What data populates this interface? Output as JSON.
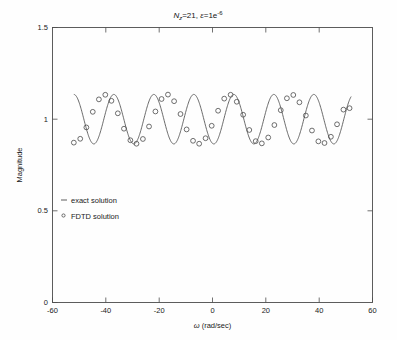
{
  "figure": {
    "background": "#fefefe",
    "axes_color": "#4d4d4d",
    "curve_color": "#595959",
    "marker_color": "#4a4a4a"
  },
  "title": {
    "n_symbol": "N",
    "n_sub": "z",
    "n_value": "=21,",
    "eps_symbol": "ε",
    "eps_value": "=1e",
    "eps_exp": "-6",
    "full": "N_z=21, ε=1e-6"
  },
  "axes": {
    "xlabel_symbol": "ω",
    "xlabel_unit": "(rad/sec)",
    "xlabel": "ω (rad/sec)",
    "ylabel": "Magnitude",
    "xticks": [
      "-60",
      "-40",
      "-20",
      "0",
      "20",
      "40",
      "60"
    ],
    "yticks": [
      "0",
      "0.5",
      "1",
      "1.5"
    ]
  },
  "legend": {
    "entries": [
      {
        "label": "exact solution",
        "marker": "line-dash-marker"
      },
      {
        "label": "FDTD solution",
        "marker": "circle-marker"
      }
    ]
  },
  "chart_data": {
    "type": "line",
    "xlabel": "ω (rad/sec)",
    "ylabel": "Magnitude",
    "xlim": [
      -60,
      60
    ],
    "ylim": [
      0,
      1.5
    ],
    "xticks": [
      -60,
      -40,
      -20,
      0,
      20,
      40,
      60
    ],
    "yticks": [
      0,
      0.5,
      1,
      1.5
    ],
    "grid": false,
    "legend_position": "inside-lower-left",
    "series": [
      {
        "name": "exact solution",
        "style": "line",
        "comment": "Smooth oscillation: magnitude ~ 1 + 0.135*cos(2*pi*(w+52)/15.0) sampled densely over w in [-52, 52]",
        "model": {
          "mean": 1.0,
          "amplitude": 0.135,
          "period": 15.0,
          "phase_ref_w": -52.0,
          "w_start": -52.0,
          "w_end": 52.0
        }
      },
      {
        "name": "FDTD solution",
        "style": "circles",
        "comment": "45 sample points on the same oscillation, spaced ~2.35 rad/sec apart, with small scatter",
        "x": [
          -52.0,
          -49.6,
          -47.3,
          -44.9,
          -42.6,
          -40.2,
          -37.9,
          -35.5,
          -33.2,
          -30.8,
          -28.5,
          -26.1,
          -23.8,
          -21.4,
          -19.1,
          -16.7,
          -14.4,
          -12.0,
          -9.7,
          -7.3,
          -5.0,
          -2.6,
          -0.3,
          2.1,
          4.4,
          6.8,
          9.1,
          11.5,
          13.8,
          16.2,
          18.5,
          20.9,
          23.2,
          25.6,
          27.9,
          30.3,
          32.6,
          35.0,
          37.3,
          39.7,
          42.0,
          44.4,
          46.7,
          49.1,
          51.4
        ],
        "y": [
          0.872,
          0.893,
          0.955,
          1.04,
          1.108,
          1.133,
          1.1,
          1.032,
          0.948,
          0.885,
          0.866,
          0.892,
          0.96,
          1.042,
          1.11,
          1.134,
          1.098,
          1.028,
          0.944,
          0.882,
          0.866,
          0.896,
          0.964,
          1.046,
          1.112,
          1.133,
          1.095,
          1.024,
          0.941,
          0.88,
          0.868,
          0.9,
          0.968,
          1.049,
          1.114,
          1.132,
          1.092,
          1.02,
          0.938,
          0.879,
          0.87,
          0.904,
          0.972,
          1.052,
          1.06
        ]
      }
    ]
  }
}
